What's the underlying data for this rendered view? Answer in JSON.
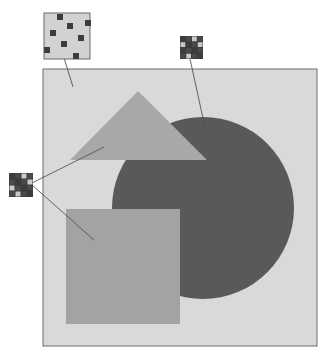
{
  "colors": {
    "page_bg": "#ffffff",
    "frame_bg": "#d9d9d9",
    "frame_border": "#6a6a6a",
    "triangle": "#a8a8a8",
    "circle": "#595959",
    "square": "#a3a3a3",
    "leader_line": "#555555",
    "patch_dark": "#3c3c3c",
    "patch_mid": "#4a4a4a",
    "patch_light": "#c9c9c9"
  },
  "frame": {
    "x": 43,
    "y": 69,
    "w": 274,
    "h": 277
  },
  "shapes": {
    "triangle": {
      "points": "138,91 70,160 207,160"
    },
    "circle": {
      "cx": 203,
      "cy": 208,
      "r": 91
    },
    "square": {
      "x": 66,
      "y": 209,
      "w": 114,
      "h": 115
    }
  },
  "insets": [
    {
      "name": "background-texture-inset",
      "x": 44,
      "y": 13,
      "w": 46,
      "h": 46,
      "fill": "#d2d2d2",
      "dots": [
        [
          57,
          14
        ],
        [
          85,
          20
        ],
        [
          67,
          23
        ],
        [
          50,
          30
        ],
        [
          78,
          35
        ],
        [
          61,
          41
        ],
        [
          44,
          47
        ],
        [
          73,
          53
        ]
      ],
      "dot_size": 6,
      "leader": {
        "x1": 64,
        "y1": 58,
        "x2": 73,
        "y2": 87
      }
    },
    {
      "name": "circle-texture-inset",
      "x": 180,
      "y": 36,
      "w": 23,
      "h": 23,
      "grid": [
        [
          0,
          0,
          1,
          0
        ],
        [
          1,
          0,
          0,
          1
        ],
        [
          0,
          0,
          0,
          0
        ],
        [
          0,
          1,
          0,
          0
        ]
      ],
      "leader": {
        "x1": 190,
        "y1": 59,
        "x2": 206,
        "y2": 132
      }
    },
    {
      "name": "shapes-texture-inset",
      "x": 9,
      "y": 173,
      "w": 24,
      "h": 24,
      "grid": [
        [
          0,
          0,
          1,
          0
        ],
        [
          0,
          0,
          0,
          1
        ],
        [
          1,
          0,
          0,
          0
        ],
        [
          0,
          1,
          0,
          0
        ]
      ],
      "leaders": [
        {
          "x1": 32,
          "y1": 183,
          "x2": 104,
          "y2": 147
        },
        {
          "x1": 32,
          "y1": 185,
          "x2": 94,
          "y2": 240
        }
      ]
    }
  ]
}
